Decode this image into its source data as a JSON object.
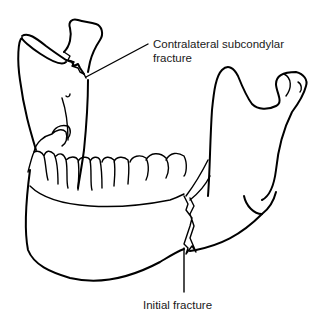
{
  "figure": {
    "labels": {
      "contralateral": "Contralateral subcondylar fracture",
      "contralateral_line1": "Contralateral subcondylar",
      "contralateral_line2": "fracture",
      "initial": "Initial fracture"
    },
    "colors": {
      "line": "#000000",
      "text": "#1a1a1a",
      "background": "#ffffff"
    }
  }
}
